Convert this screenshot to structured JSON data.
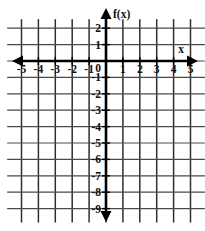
{
  "figure": {
    "kind": "cartesian-coordinate-grid",
    "background_color": "#ffffff",
    "axis_color": "#000000",
    "grid_color": "#3a3a3a"
  },
  "axes": {
    "x_axis_label": "x",
    "y_axis_label": "f(x)",
    "origin_label": "0",
    "x_arrow_left": "arrow-left-icon",
    "x_arrow_right": "arrow-right-icon",
    "y_arrow_up": "arrow-up-icon",
    "y_arrow_down": "arrow-down-icon"
  },
  "x_ticks": [
    {
      "value": -5,
      "label": "-5"
    },
    {
      "value": -4,
      "label": "-4"
    },
    {
      "value": -3,
      "label": "-3"
    },
    {
      "value": -2,
      "label": "-2"
    },
    {
      "value": -1,
      "label": "-1"
    },
    {
      "value": 1,
      "label": "1"
    },
    {
      "value": 2,
      "label": "2"
    },
    {
      "value": 3,
      "label": "3"
    },
    {
      "value": 4,
      "label": "4"
    },
    {
      "value": 5,
      "label": "5"
    }
  ],
  "y_ticks": [
    {
      "value": 2,
      "label": "2"
    },
    {
      "value": 1,
      "label": "1"
    },
    {
      "value": -1,
      "label": "-1"
    },
    {
      "value": -2,
      "label": "-2"
    },
    {
      "value": -3,
      "label": "-3"
    },
    {
      "value": -4,
      "label": "-4"
    },
    {
      "value": -5,
      "label": "-5"
    },
    {
      "value": -6,
      "label": "-6"
    },
    {
      "value": -7,
      "label": "-7"
    },
    {
      "value": -8,
      "label": "-8"
    },
    {
      "value": -9,
      "label": "-9"
    }
  ],
  "chart_data": {
    "type": "line",
    "title": "",
    "subtitle": "",
    "xlabel": "x",
    "ylabel": "f(x)",
    "xlim": [
      -5,
      5
    ],
    "ylim": [
      -9,
      2
    ],
    "xticks": [
      -5,
      -4,
      -3,
      -2,
      -1,
      0,
      1,
      2,
      3,
      4,
      5
    ],
    "yticks": [
      2,
      1,
      0,
      -1,
      -2,
      -3,
      -4,
      -5,
      -6,
      -7,
      -8,
      -9
    ],
    "xtick_labels": [
      "-5",
      "-4",
      "-3",
      "-2",
      "-1",
      "0",
      "1",
      "2",
      "3",
      "4",
      "5"
    ],
    "ytick_labels": [
      "2",
      "1",
      "0",
      "-1",
      "-2",
      "-3",
      "-4",
      "-5",
      "-6",
      "-7",
      "-8",
      "-9"
    ],
    "grid": true,
    "legend": null,
    "legend_position": "none",
    "annotations": [],
    "series": [],
    "note": "Empty graph paper: no data curve is plotted; only the labeled coordinate grid is shown."
  }
}
